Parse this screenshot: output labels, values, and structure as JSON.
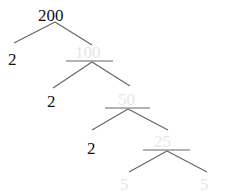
{
  "diagram": {
    "type": "factor-tree",
    "root": "200",
    "colors": {
      "dark_text": "#111111",
      "faint_text": "#e6e6e6",
      "line": "#666666"
    },
    "nodes": [
      {
        "id": "n200",
        "label": "200",
        "style": "dark"
      },
      {
        "id": "n2a",
        "label": "2",
        "style": "dark"
      },
      {
        "id": "n100",
        "label": "100",
        "style": "faint"
      },
      {
        "id": "n2b",
        "label": "2",
        "style": "dark"
      },
      {
        "id": "n50",
        "label": "50",
        "style": "faint"
      },
      {
        "id": "n2c",
        "label": "2",
        "style": "dark"
      },
      {
        "id": "n25",
        "label": "25",
        "style": "faint"
      },
      {
        "id": "n5a",
        "label": "5",
        "style": "faint"
      },
      {
        "id": "n5b",
        "label": "5",
        "style": "faint"
      }
    ],
    "edges": [
      [
        "200",
        "2"
      ],
      [
        "200",
        "100"
      ],
      [
        "100",
        "2"
      ],
      [
        "100",
        "50"
      ],
      [
        "50",
        "2"
      ],
      [
        "50",
        "25"
      ],
      [
        "25",
        "5"
      ],
      [
        "25",
        "5"
      ]
    ]
  }
}
